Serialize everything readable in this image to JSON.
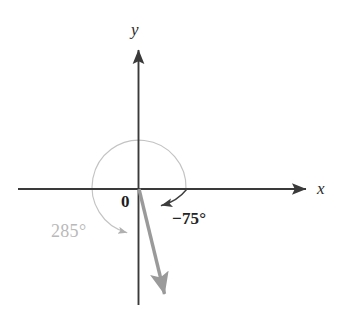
{
  "figure": {
    "background_color": "#ffffff",
    "axis_labels": {
      "x": "x",
      "y": "y"
    },
    "origin_label": "0",
    "angles": [
      {
        "name": "negative-angle",
        "label": "−75°",
        "value": -75,
        "unit": "degrees",
        "direction": "clockwise",
        "color": "#252525",
        "arc_from_deg": 0,
        "arc_to_deg": -75
      },
      {
        "name": "positive-coterminal-angle",
        "label": "285°",
        "value": 285,
        "unit": "degrees",
        "direction": "counterclockwise",
        "color": "#b9b9b9",
        "arc_from_deg": 0,
        "arc_to_deg": 285
      }
    ],
    "terminal_ray": {
      "name": "terminal-side-ray",
      "angle_deg": -75,
      "color": "#9a9a9a"
    },
    "colors": {
      "axis": "#3a3a3a",
      "dark_arc": "#3d3d3d",
      "light_arc": "#c3c3c3",
      "ray": "#9a9a9a",
      "gray_text": "#b9b9b9",
      "dark_text": "#252525"
    }
  }
}
